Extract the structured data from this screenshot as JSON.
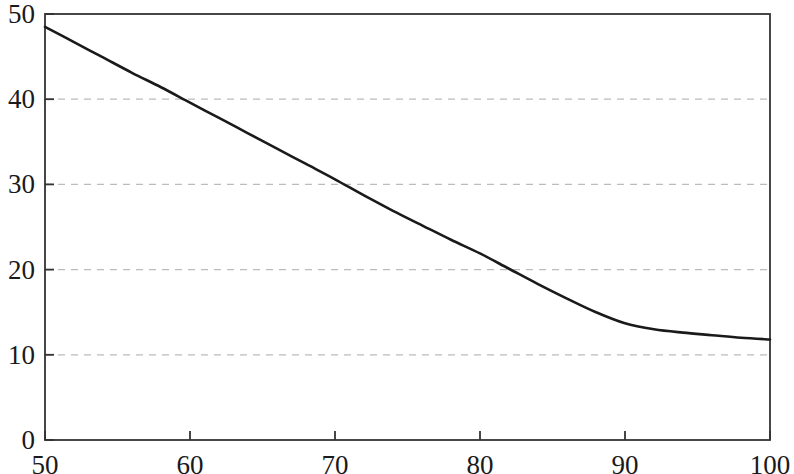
{
  "chart_data": {
    "type": "line",
    "title": "",
    "subtitle": "",
    "xlabel": "",
    "ylabel": "",
    "xlim": [
      50,
      100
    ],
    "ylim": [
      0,
      50
    ],
    "xticks": [
      50,
      60,
      70,
      80,
      90,
      100
    ],
    "yticks": [
      0,
      10,
      20,
      30,
      40,
      50
    ],
    "xtick_labels": [
      "50",
      "60",
      "70",
      "80",
      "90",
      "100"
    ],
    "ytick_labels": [
      "0",
      "10",
      "20",
      "30",
      "40",
      "50"
    ],
    "grid": {
      "horizontal": true,
      "vertical": false,
      "style": "dashed",
      "color": "#bcbcbc",
      "at": [
        10,
        20,
        30,
        40
      ]
    },
    "legend": {
      "visible": false,
      "position": "none",
      "entries": []
    },
    "annotations": [],
    "axes_style": {
      "frame": "full-box",
      "frame_color": "#333333",
      "tick_direction": "in"
    },
    "series": [
      {
        "name": "curve",
        "color": "#1a1a1a",
        "line_width": 2.6,
        "marker": "none",
        "x": [
          50,
          52,
          54,
          56,
          58,
          60,
          62,
          64,
          66,
          68,
          70,
          72,
          74,
          76,
          78,
          80,
          82,
          84,
          86,
          88,
          90,
          92,
          94,
          96,
          98,
          100
        ],
        "values": [
          48.5,
          46.7,
          44.9,
          43.1,
          41.4,
          39.6,
          37.8,
          36.0,
          34.2,
          32.4,
          30.6,
          28.7,
          26.9,
          25.2,
          23.5,
          21.9,
          20.1,
          18.3,
          16.6,
          15.0,
          13.7,
          13.0,
          12.6,
          12.3,
          12.0,
          11.8
        ]
      }
    ]
  },
  "plot_geometry": {
    "left": 45,
    "right": 770,
    "top": 14,
    "bottom": 440
  }
}
